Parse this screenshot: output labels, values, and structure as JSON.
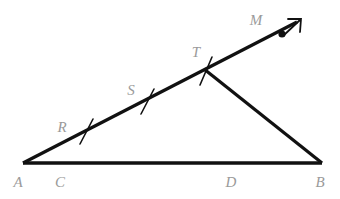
{
  "figure": {
    "kind": "geometry-diagram",
    "background_color": "#ffffff",
    "stroke_color": "#111111",
    "label_color": "#9a9a9a"
  },
  "points": {
    "A": {
      "label": "A",
      "x": 23,
      "y": 163,
      "label_x": 24,
      "label_y": 186
    },
    "B": {
      "label": "B",
      "x": 322,
      "y": 163,
      "label_x": 320,
      "label_y": 186
    },
    "C": {
      "label": "C",
      "x": 60,
      "y": 163,
      "label_x": 60,
      "label_y": 186
    },
    "D": {
      "label": "D",
      "x": 231,
      "y": 163,
      "label_x": 231,
      "label_y": 186
    },
    "R": {
      "label": "R",
      "x": 86,
      "y": 132,
      "label_x": 62,
      "label_y": 130
    },
    "S": {
      "label": "S",
      "x": 147,
      "y": 102,
      "label_x": 131,
      "label_y": 93
    },
    "T": {
      "label": "T",
      "x": 206,
      "y": 71,
      "label_x": 194,
      "label_y": 56
    },
    "M": {
      "label": "M",
      "x": 283,
      "y": 33,
      "label_x": 256,
      "label_y": 24
    }
  },
  "segments": [
    {
      "name": "base-AB",
      "from": "A",
      "to": "B",
      "width": 3.2
    },
    {
      "name": "ray-A-to-M",
      "from": "A",
      "to": "arrow-tip",
      "width": 3.2
    },
    {
      "name": "side-T-to-B",
      "from": "T",
      "to": "B",
      "width": 3.2
    }
  ],
  "ray": {
    "name": "ray-AM",
    "start_x": 23,
    "start_y": 163,
    "end_x": 299,
    "end_y": 21,
    "dot_x": 283,
    "dot_y": 33,
    "dot_radius": 3.4,
    "arrow_tip_x": 301,
    "arrow_tip_y": 19
  },
  "tick_marks": [
    {
      "name": "tick-R",
      "cx": 86,
      "cy": 132,
      "x1": 80,
      "y1": 143,
      "x2": 92,
      "y2": 120
    },
    {
      "name": "tick-S",
      "cx": 147,
      "cy": 102,
      "x1": 141,
      "y1": 113,
      "x2": 153,
      "y2": 90
    },
    {
      "name": "tick-T",
      "cx": 206,
      "cy": 71,
      "x1": 201,
      "y1": 84,
      "x2": 211,
      "y2": 58
    }
  ],
  "labels": [
    {
      "key": "A",
      "text": "A"
    },
    {
      "key": "C",
      "text": "C"
    },
    {
      "key": "D",
      "text": "D"
    },
    {
      "key": "B",
      "text": "B"
    },
    {
      "key": "R",
      "text": "R"
    },
    {
      "key": "S",
      "text": "S"
    },
    {
      "key": "T",
      "text": "T"
    },
    {
      "key": "M",
      "text": "M"
    }
  ]
}
